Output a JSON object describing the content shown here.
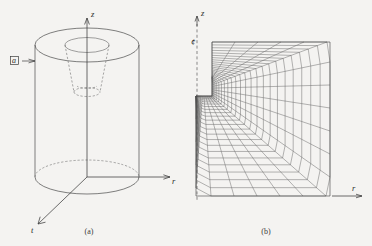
{
  "figure": {
    "title": "",
    "background_color": "#f4f3f1",
    "line_color": "#4a4a4a",
    "panels": [
      {
        "id": "a",
        "caption": "(a)",
        "description": "hollow-cylinder-3d-sketch",
        "axes": [
          {
            "name": "z",
            "label": "z",
            "direction": "up"
          },
          {
            "name": "r",
            "label": "r",
            "direction": "right"
          },
          {
            "name": "theta",
            "label": "t",
            "direction": "down-left"
          }
        ],
        "annotations": [
          {
            "name": "side-load-symbol",
            "label": "a",
            "leader": "arrow-right"
          }
        ]
      },
      {
        "id": "b",
        "caption": "(b)",
        "description": "graded-finite-element-mesh",
        "axes": [
          {
            "name": "z",
            "label": "z",
            "direction": "up"
          },
          {
            "name": "r",
            "label": "r",
            "direction": "right"
          },
          {
            "name": "axis-of-symmetry",
            "label": "¢",
            "direction": "vertical-dashed"
          }
        ]
      }
    ]
  },
  "chart_data": {
    "type": "diagram",
    "title": "",
    "panel_a": {
      "shape": "hollow cylinder with central bore and conical cavity",
      "cylinder": {
        "center_x": 87,
        "top_y": 45,
        "bottom_y": 177,
        "radius_x": 52,
        "radius_y": 17
      },
      "bore": {
        "radius_x": 22,
        "radius_y": 7.5,
        "top_y": 45
      },
      "cone": {
        "apex_y": 94,
        "base_y": 45,
        "base_radius_x": 22
      }
    },
    "panel_b": {
      "domain": {
        "x0": 196,
        "x1": 330,
        "y0": 42,
        "y1": 196
      },
      "notch": {
        "x": 196,
        "y_top": 77,
        "y_bottom": 96,
        "width": 16
      },
      "grading": "refined toward upper-left re-entrant corner",
      "radial_divisions": 24,
      "circumferential_divisions": 22
    }
  }
}
